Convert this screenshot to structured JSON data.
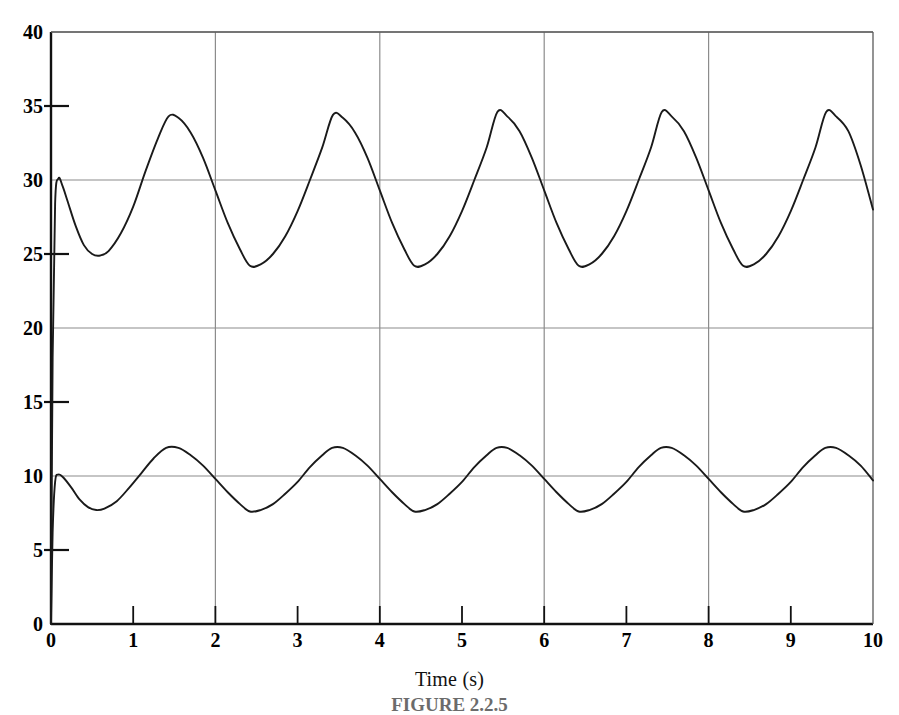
{
  "chart_data": {
    "type": "line",
    "title": "",
    "xlabel": "Time (s)",
    "ylabel": "",
    "xlim": [
      0,
      10
    ],
    "ylim": [
      0,
      40
    ],
    "grid": true,
    "legend": null,
    "x_ticks": [
      "0",
      "1",
      "2",
      "3",
      "4",
      "5",
      "6",
      "7",
      "8",
      "9",
      "10"
    ],
    "x_tick_values": [
      0,
      1,
      2,
      3,
      4,
      5,
      6,
      7,
      8,
      9,
      10
    ],
    "y_ticks": [
      "0",
      "5",
      "10",
      "15",
      "20",
      "25",
      "30",
      "35",
      "40"
    ],
    "y_tick_values": [
      0,
      5,
      10,
      15,
      20,
      25,
      30,
      35,
      40
    ],
    "y_gridline_values": [
      0,
      10,
      20,
      30,
      40
    ],
    "y_minor_tick_values": [
      5,
      15,
      25,
      35
    ],
    "x_gridline_values": [
      2,
      4,
      6,
      8
    ],
    "line_color": "#1a1a1a",
    "grid_color": "#8c8c8c",
    "axis_color": "#111111",
    "series": [
      {
        "name": "upper-response",
        "description": "Oscillatory response settling about 29.3 with amplitude ~5, period 2 s",
        "mean": 29.3,
        "amplitude": 5.05,
        "period": 2.0,
        "phase_deg": 200,
        "start_value": 0,
        "step_to": 30.1,
        "points": [
          [
            0.0,
            0.0
          ],
          [
            0.02,
            18.0
          ],
          [
            0.05,
            28.4
          ],
          [
            0.09,
            30.1
          ],
          [
            0.14,
            29.6
          ],
          [
            0.2,
            28.6
          ],
          [
            0.3,
            26.9
          ],
          [
            0.4,
            25.6
          ],
          [
            0.5,
            25.0
          ],
          [
            0.6,
            24.9
          ],
          [
            0.7,
            25.2
          ],
          [
            0.85,
            26.4
          ],
          [
            1.0,
            28.2
          ],
          [
            1.15,
            30.6
          ],
          [
            1.3,
            32.8
          ],
          [
            1.43,
            34.3
          ],
          [
            1.55,
            34.2
          ],
          [
            1.7,
            33.2
          ],
          [
            1.85,
            31.5
          ],
          [
            2.0,
            29.3
          ],
          [
            2.15,
            27.1
          ],
          [
            2.3,
            25.3
          ],
          [
            2.42,
            24.2
          ],
          [
            2.55,
            24.3
          ],
          [
            2.7,
            25.0
          ],
          [
            2.85,
            26.2
          ],
          [
            3.0,
            27.9
          ],
          [
            3.15,
            30.0
          ],
          [
            3.3,
            32.2
          ],
          [
            3.43,
            34.4
          ],
          [
            3.55,
            34.2
          ],
          [
            3.7,
            33.2
          ],
          [
            3.85,
            31.5
          ],
          [
            4.0,
            29.3
          ],
          [
            4.15,
            27.1
          ],
          [
            4.3,
            25.3
          ],
          [
            4.42,
            24.2
          ],
          [
            4.55,
            24.3
          ],
          [
            4.7,
            25.0
          ],
          [
            4.85,
            26.2
          ],
          [
            5.0,
            27.9
          ],
          [
            5.15,
            30.0
          ],
          [
            5.3,
            32.2
          ],
          [
            5.43,
            34.6
          ],
          [
            5.55,
            34.3
          ],
          [
            5.7,
            33.3
          ],
          [
            5.85,
            31.5
          ],
          [
            6.0,
            29.3
          ],
          [
            6.15,
            27.1
          ],
          [
            6.3,
            25.3
          ],
          [
            6.42,
            24.2
          ],
          [
            6.55,
            24.3
          ],
          [
            6.7,
            25.0
          ],
          [
            6.85,
            26.2
          ],
          [
            7.0,
            27.9
          ],
          [
            7.15,
            30.0
          ],
          [
            7.3,
            32.2
          ],
          [
            7.43,
            34.6
          ],
          [
            7.55,
            34.3
          ],
          [
            7.7,
            33.3
          ],
          [
            7.85,
            31.5
          ],
          [
            8.0,
            29.3
          ],
          [
            8.15,
            27.1
          ],
          [
            8.3,
            25.3
          ],
          [
            8.42,
            24.2
          ],
          [
            8.55,
            24.3
          ],
          [
            8.7,
            25.0
          ],
          [
            8.85,
            26.2
          ],
          [
            9.0,
            27.9
          ],
          [
            9.15,
            30.0
          ],
          [
            9.3,
            32.2
          ],
          [
            9.43,
            34.6
          ],
          [
            9.55,
            34.3
          ],
          [
            9.7,
            33.3
          ],
          [
            9.85,
            31.0
          ],
          [
            10.0,
            28.0
          ]
        ]
      },
      {
        "name": "lower-response",
        "description": "Oscillatory response settling about 9.8 with amplitude ~2.1, period 2 s",
        "mean": 9.8,
        "amplitude": 2.1,
        "period": 2.0,
        "phase_deg": 200,
        "start_value": 0,
        "step_to": 10.1,
        "points": [
          [
            0.0,
            0.0
          ],
          [
            0.02,
            6.2
          ],
          [
            0.05,
            9.6
          ],
          [
            0.09,
            10.1
          ],
          [
            0.15,
            9.9
          ],
          [
            0.25,
            9.2
          ],
          [
            0.35,
            8.4
          ],
          [
            0.45,
            7.9
          ],
          [
            0.55,
            7.7
          ],
          [
            0.65,
            7.8
          ],
          [
            0.8,
            8.3
          ],
          [
            0.95,
            9.2
          ],
          [
            1.1,
            10.2
          ],
          [
            1.25,
            11.2
          ],
          [
            1.4,
            11.9
          ],
          [
            1.55,
            11.9
          ],
          [
            1.7,
            11.4
          ],
          [
            1.85,
            10.7
          ],
          [
            2.0,
            9.8
          ],
          [
            2.15,
            8.9
          ],
          [
            2.3,
            8.1
          ],
          [
            2.42,
            7.6
          ],
          [
            2.55,
            7.7
          ],
          [
            2.7,
            8.1
          ],
          [
            2.85,
            8.8
          ],
          [
            3.0,
            9.6
          ],
          [
            3.15,
            10.6
          ],
          [
            3.3,
            11.4
          ],
          [
            3.42,
            11.9
          ],
          [
            3.55,
            11.9
          ],
          [
            3.7,
            11.4
          ],
          [
            3.85,
            10.7
          ],
          [
            4.0,
            9.8
          ],
          [
            4.15,
            8.9
          ],
          [
            4.3,
            8.1
          ],
          [
            4.42,
            7.6
          ],
          [
            4.55,
            7.7
          ],
          [
            4.7,
            8.1
          ],
          [
            4.85,
            8.8
          ],
          [
            5.0,
            9.6
          ],
          [
            5.15,
            10.6
          ],
          [
            5.3,
            11.4
          ],
          [
            5.42,
            11.9
          ],
          [
            5.55,
            11.9
          ],
          [
            5.7,
            11.4
          ],
          [
            5.85,
            10.7
          ],
          [
            6.0,
            9.8
          ],
          [
            6.15,
            8.9
          ],
          [
            6.3,
            8.1
          ],
          [
            6.42,
            7.6
          ],
          [
            6.55,
            7.7
          ],
          [
            6.7,
            8.1
          ],
          [
            6.85,
            8.8
          ],
          [
            7.0,
            9.6
          ],
          [
            7.15,
            10.6
          ],
          [
            7.3,
            11.4
          ],
          [
            7.42,
            11.9
          ],
          [
            7.55,
            11.9
          ],
          [
            7.7,
            11.4
          ],
          [
            7.85,
            10.7
          ],
          [
            8.0,
            9.8
          ],
          [
            8.15,
            8.9
          ],
          [
            8.3,
            8.1
          ],
          [
            8.42,
            7.6
          ],
          [
            8.55,
            7.7
          ],
          [
            8.7,
            8.1
          ],
          [
            8.85,
            8.8
          ],
          [
            9.0,
            9.6
          ],
          [
            9.15,
            10.6
          ],
          [
            9.3,
            11.4
          ],
          [
            9.42,
            11.9
          ],
          [
            9.55,
            11.9
          ],
          [
            9.7,
            11.4
          ],
          [
            9.85,
            10.7
          ],
          [
            10.0,
            9.7
          ]
        ]
      }
    ]
  },
  "axis": {
    "xlabel": "Time (s)"
  },
  "caption": {
    "text": "FIGURE 2.2.5"
  }
}
